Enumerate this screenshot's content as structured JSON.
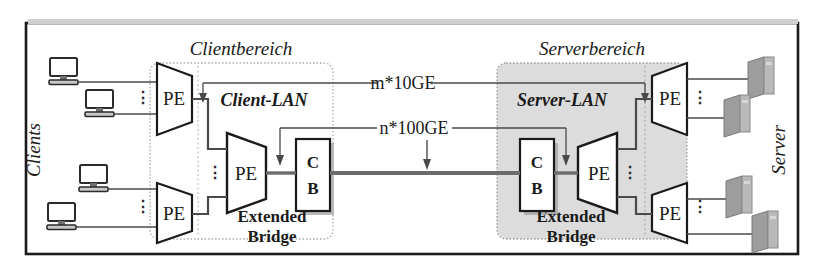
{
  "figure": {
    "type": "network-diagram",
    "regions": [
      {
        "id": "client",
        "title": "Clientbereich",
        "lan_label": "Client-LAN",
        "bridge_label_line1": "Extended",
        "bridge_label_line2": "Bridge",
        "fill": "#ffffff"
      },
      {
        "id": "server",
        "title": "Serverbereich",
        "lan_label": "Server-LAN",
        "bridge_label_line1": "Extended",
        "bridge_label_line2": "Bridge",
        "fill": "#dcdcdc"
      }
    ],
    "side_labels": {
      "left": "Clients",
      "right": "Server"
    },
    "link_labels": [
      {
        "id": "uplink-10ge",
        "text": "m*10GE"
      },
      {
        "id": "uplink-100ge",
        "text": "n*100GE"
      }
    ],
    "nodes": {
      "pe_label": "PE",
      "cb_label_line1": "C",
      "cb_label_line2": "B",
      "ellipsis": "⋮"
    },
    "endpoints": {
      "client_icon": "desktop-computer",
      "server_icon": "server-tower",
      "client_count": 4,
      "server_count": 4
    },
    "colors": {
      "outline": "#1a1a1a",
      "line": "#4a4a4a",
      "region_fill_server": "#dcdcdc",
      "region_border": "#9a9a9a",
      "trunk": "#6b6b6b",
      "frame": "#1a1a1a",
      "icon_gray": "#a8a8a8"
    }
  }
}
